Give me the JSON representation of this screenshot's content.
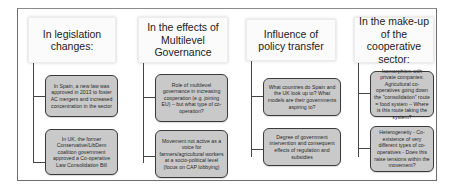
{
  "diagram": {
    "columns": [
      {
        "header": "In legislation changes:",
        "items": [
          "In Spain, a new law was approved in 2013 to foster AC mergers and increased concentration in the sector",
          "In UK, the former Conservative/LibDem coalition government approved a Co-operative Law Consolidation Bill"
        ]
      },
      {
        "header": "In the effects of Multilevel Governance",
        "items": [
          "Role of multilevel governance in increasing cooperation (e.g. joining EU) – but what type of co-operation?",
          "Movement not active as a voice for farmers/agricultural workers at a socio-political level (focus on CAP lobbying)"
        ]
      },
      {
        "header": "Influence of policy transfer",
        "items": [
          "What countries do Spain and the UK look up to? What models are their governments aspiring to?",
          "Degree of government intervention and consequent effects of regulation and subsidies"
        ]
      },
      {
        "header": "In the make-up of the cooperative sector:",
        "items": [
          "Isomorphism with private companies: Agricultural co-operatives going down the \"consolidation\" route = food system – Where is this route taking the system?",
          "Heterogeneity - Co-existence of very different types of co-operatives - Does this raise tensions within the movement?"
        ]
      }
    ],
    "colors": {
      "frame_border": "#6e6e6e",
      "header_bg": "#fbfbfb",
      "child_bg": "#c9c9c9",
      "child_border": "#3a3a3a",
      "connector": "#444444"
    }
  }
}
